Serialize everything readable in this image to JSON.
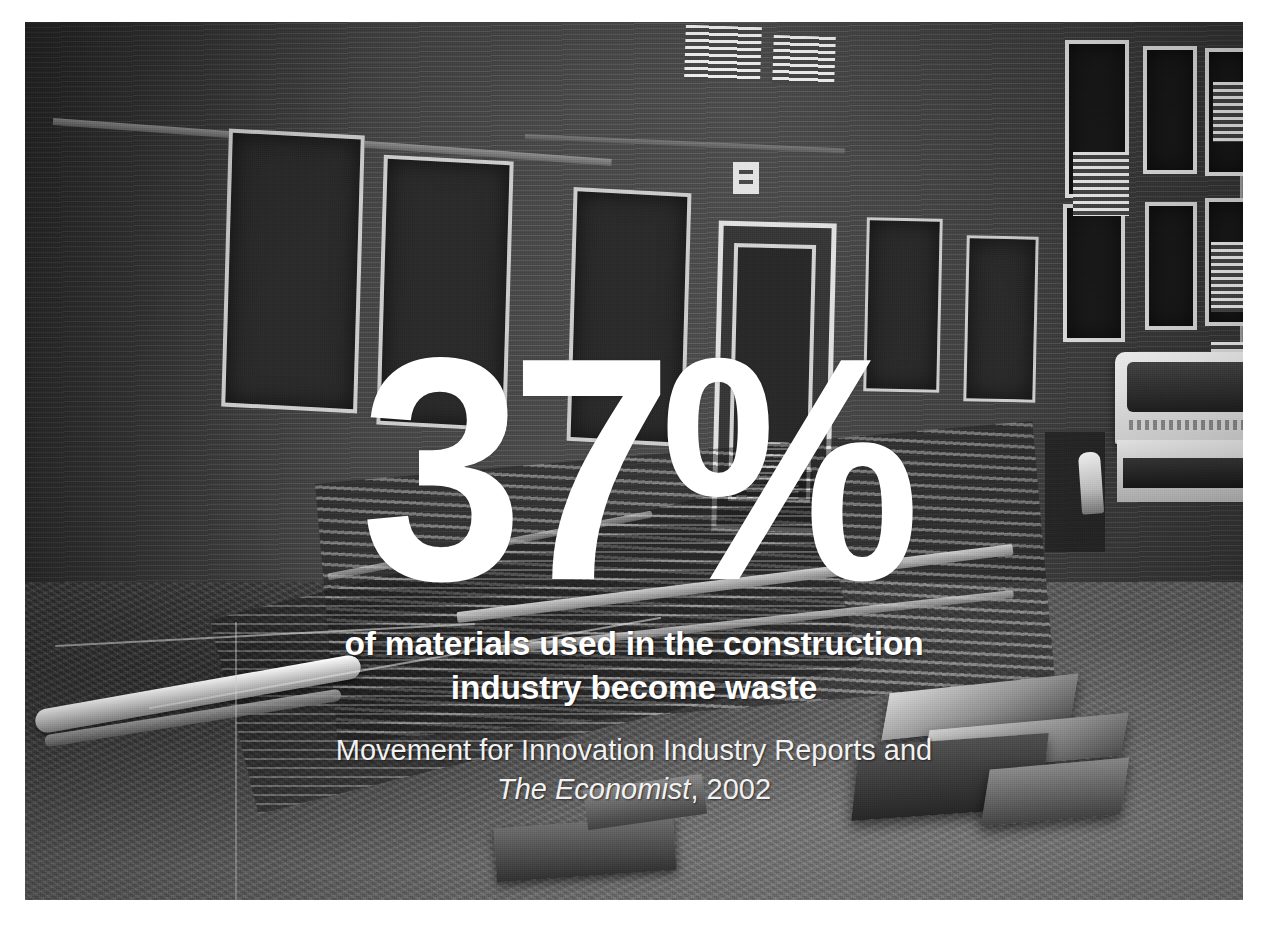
{
  "slide": {
    "type": "photo-statistic-slide",
    "background_color": "#ffffff"
  },
  "photo": {
    "name": "construction-site-photo",
    "description": "Black and white photograph of a brick building facade under construction with piles of discarded timber, scaffolding planks, pallets and rubble in the foreground and a white truck parked at the right.",
    "treatment": "grayscale",
    "elements": [
      "brick-facade",
      "windows",
      "entrance-door",
      "louvered-vents",
      "lumber-pile",
      "white-pipe",
      "wooden-pallets",
      "rubble-ground",
      "white-truck",
      "worker"
    ]
  },
  "statistic": {
    "value": "37%",
    "color": "#ffffff"
  },
  "headline": {
    "color": "#ffffff",
    "lines": [
      "of materials used in the construction",
      "industry become waste"
    ]
  },
  "attribution": {
    "color": "#f2f2f2",
    "line1": "Movement for Innovation Industry Reports and",
    "source_title": "The Economist",
    "source_rest": ", 2002"
  },
  "palette": {
    "text_white": "#ffffff",
    "brick_gray": "#4e4e4e",
    "ground_gray": "#6f6f6f",
    "window_dark": "#2e2e2e",
    "frame_light": "#c9c9c9",
    "page_white": "#ffffff"
  }
}
